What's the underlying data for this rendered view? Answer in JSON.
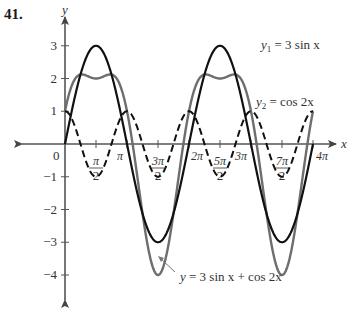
{
  "problem_number": "41.",
  "axes": {
    "x_label": "x",
    "y_label": "y",
    "origin_label": "0"
  },
  "colors": {
    "y1": "#111111",
    "y2": "#111111",
    "sum": "#6e6e6e",
    "axis": "#555555"
  },
  "chart_data": {
    "type": "line",
    "title": "",
    "xlabel": "x",
    "ylabel": "y",
    "xlim": [
      0,
      12.566
    ],
    "ylim": [
      -4,
      3
    ],
    "grid": false,
    "x_ticks": [
      {
        "value": 1.5708,
        "label_num": "π",
        "label_den": "2",
        "fraction": true
      },
      {
        "value": 3.1416,
        "label": "π",
        "fraction": false
      },
      {
        "value": 4.7124,
        "label_num": "3π",
        "label_den": "2",
        "fraction": true
      },
      {
        "value": 6.2832,
        "label": "2π",
        "fraction": false
      },
      {
        "value": 7.854,
        "label_num": "5π",
        "label_den": "2",
        "fraction": true
      },
      {
        "value": 9.4248,
        "label": "3π",
        "fraction": false
      },
      {
        "value": 10.9956,
        "label_num": "7π",
        "label_den": "2",
        "fraction": true
      },
      {
        "value": 12.5664,
        "label": "4π",
        "fraction": false
      }
    ],
    "y_ticks": [
      3,
      2,
      1,
      -1,
      -2,
      -3,
      -4
    ],
    "series": [
      {
        "name": "y1 = 3 sin x",
        "function": "3*sin(x)",
        "style": "solid-black",
        "x": [
          0,
          1.5708,
          3.1416,
          4.7124,
          6.2832,
          7.854,
          9.4248,
          10.9956,
          12.5664
        ],
        "values": [
          0,
          3,
          0,
          -3,
          0,
          3,
          0,
          -3,
          0
        ]
      },
      {
        "name": "y2 = cos 2x",
        "function": "cos(2*x)",
        "style": "dashed-black",
        "x": [
          0,
          1.5708,
          3.1416,
          4.7124,
          6.2832,
          7.854,
          9.4248,
          10.9956,
          12.5664
        ],
        "values": [
          1,
          -1,
          1,
          -1,
          1,
          -1,
          1,
          -1,
          1
        ]
      },
      {
        "name": "y = 3 sin x + cos 2x",
        "function": "3*sin(x)+cos(2*x)",
        "style": "solid-gray",
        "x": [
          0,
          0.848,
          1.5708,
          2.294,
          3.1416,
          4.7124,
          6.2832,
          7.854,
          9.4248,
          10.9956,
          12.5664
        ],
        "values": [
          1,
          2.125,
          2,
          2.125,
          1,
          -4,
          1,
          2,
          1,
          -4,
          1
        ]
      }
    ],
    "annotations": [
      {
        "text_prefix": "y",
        "sub": "1",
        "text_suffix": " = 3 sin x",
        "x_px": 261,
        "y_px": 49
      },
      {
        "text_prefix": "y",
        "sub": "2",
        "text_suffix": " = cos 2x",
        "x_px": 256,
        "y_px": 106
      },
      {
        "text_prefix": "y",
        "sub": "",
        "text_suffix": " = 3 sin x + cos 2x",
        "x_px": 180,
        "y_px": 281
      }
    ]
  }
}
